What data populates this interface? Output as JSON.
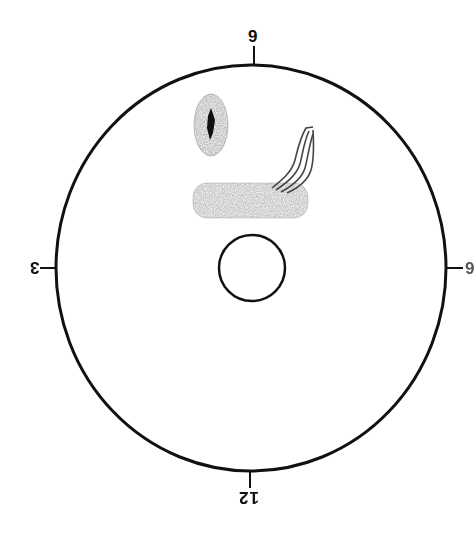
{
  "diagram": {
    "type": "fundus-drawing-chart",
    "orientation": "inverted",
    "clock_labels": {
      "top": "9",
      "left": "3",
      "bottom": "12",
      "right": "6"
    },
    "outer_circle": {
      "cx": 251,
      "cy": 268,
      "rx": 195,
      "ry": 203,
      "stroke": "#111111"
    },
    "inner_circle": {
      "cx": 252,
      "cy": 268,
      "r": 34,
      "stroke": "#111111"
    },
    "annotations": [
      {
        "name": "pigmented-lesion",
        "shape": "oval",
        "fill": "#9a9a9a",
        "core_color": "#111111"
      },
      {
        "name": "shaded-band",
        "shape": "horizontal-band",
        "fill": "#a8a8a8"
      },
      {
        "name": "vessel-lines",
        "shape": "wavy-lines",
        "stroke": "#444444"
      }
    ],
    "colors": {
      "background": "#ffffff",
      "ink": "#111111",
      "shading": "#9e9e9e"
    }
  }
}
